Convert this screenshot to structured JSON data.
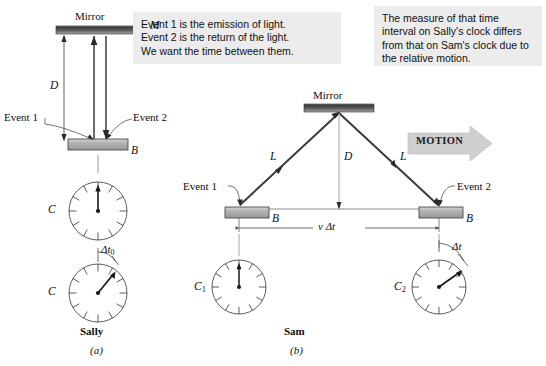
{
  "figure": {
    "panels": [
      {
        "id": "a",
        "label": "(a)",
        "observer": "Sally"
      },
      {
        "id": "b",
        "label": "(b)",
        "observer": "Sam"
      }
    ]
  },
  "callouts": {
    "left": "Event 1 is the emission of light.\nEvent 2 is the return of the light.\nWe want the time between them.",
    "right": "The measure of that time interval on Sally's clock differs from that on Sam's clock due to the relative motion."
  },
  "panel_a": {
    "mirror_label": "Mirror",
    "mirror_symbol": "M",
    "distance_label": "D",
    "event1_label": "Event 1",
    "event2_label": "Event 2",
    "block_label": "B",
    "clock_top_label": "C",
    "clock_bottom_label": "C",
    "interval_label": "Δt",
    "interval_sub": "0",
    "observer_label": "Sally",
    "panel_label": "(a)"
  },
  "panel_b": {
    "mirror_label": "Mirror",
    "distance_label": "D",
    "path_label_left": "L",
    "path_label_right": "L",
    "event1_label": "Event 1",
    "event2_label": "Event 2",
    "block_label_left": "B",
    "block_label_right": "B",
    "displacement_label": "v Δt",
    "motion_label": "MOTION",
    "clock_left_label": "C",
    "clock_left_sub": "1",
    "clock_right_label": "C",
    "clock_right_sub": "2",
    "interval_label": "Δt",
    "observer_label": "Sam",
    "panel_label": "(b)"
  },
  "colors": {
    "background": "#ffffff",
    "callout_background": "#ececed",
    "ink": "#101010",
    "mirror_dark": "#4a4a4a",
    "mirror_light": "#b9b9b9",
    "block_fill": "#b4b4b4",
    "beam": "#3c3c3c",
    "thin_line": "#8c8c8c",
    "motion_arrow": "#cfcfcf"
  }
}
